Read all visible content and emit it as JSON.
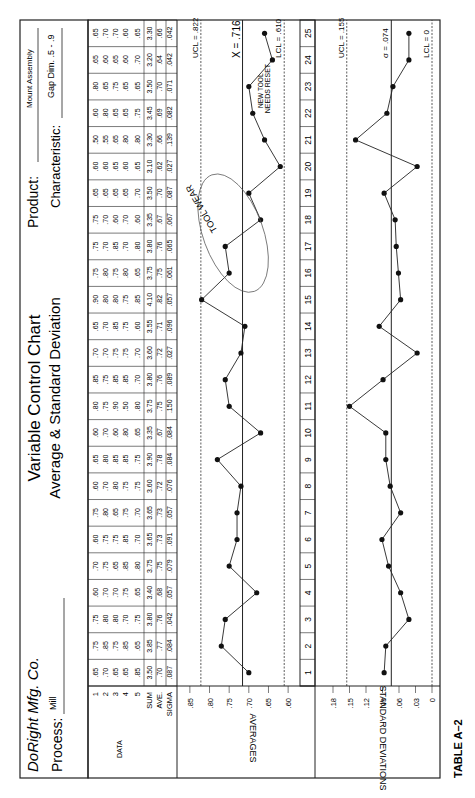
{
  "header": {
    "company": "DoRight Mfg. Co.",
    "process_label": "Process:",
    "process_value": "Mill",
    "title_line1": "Variable Control Chart",
    "title_line2": "Average & Standard Deviation",
    "product_label": "Product:",
    "product_value": "Mount Assembly",
    "characteristic_label": "Characteristic:",
    "characteristic_value": "Gap Dim. .5 - .9"
  },
  "table": {
    "row_labels": [
      "1",
      "2",
      "3",
      "4",
      "5",
      "SUM",
      "AVE.",
      "SIGMA"
    ],
    "data_label": "DATA",
    "columns": [
      {
        "sample": 1,
        "data": [
          ".65",
          ".70",
          ".65",
          ".65",
          ".85"
        ],
        "sum": "3.50",
        "ave": ".70",
        "sigma": ".087"
      },
      {
        "sample": 2,
        "data": [
          ".75",
          ".85",
          ".75",
          ".85",
          ".65"
        ],
        "sum": "3.85",
        "ave": ".77",
        "sigma": ".084"
      },
      {
        "sample": 3,
        "data": [
          ".75",
          ".80",
          ".80",
          ".70",
          ".75"
        ],
        "sum": "3.80",
        "ave": ".76",
        "sigma": ".042"
      },
      {
        "sample": 4,
        "data": [
          ".60",
          ".70",
          ".70",
          ".75",
          ".65"
        ],
        "sum": "3.40",
        "ave": ".68",
        "sigma": ".057"
      },
      {
        "sample": 5,
        "data": [
          ".70",
          ".75",
          ".65",
          ".85",
          ".80"
        ],
        "sum": "3.75",
        "ave": ".75",
        "sigma": ".079"
      },
      {
        "sample": 6,
        "data": [
          ".60",
          ".75",
          ".75",
          ".85",
          ".70"
        ],
        "sum": "3.65",
        "ave": ".73",
        "sigma": ".091"
      },
      {
        "sample": 7,
        "data": [
          ".75",
          ".80",
          ".65",
          ".75",
          ".70"
        ],
        "sum": "3.65",
        "ave": ".73",
        "sigma": ".057"
      },
      {
        "sample": 8,
        "data": [
          ".60",
          ".70",
          ".80",
          ".75",
          ".75"
        ],
        "sum": "3.60",
        "ave": ".72",
        "sigma": ".076"
      },
      {
        "sample": 9,
        "data": [
          ".65",
          ".80",
          ".85",
          ".85",
          ".75"
        ],
        "sum": "3.90",
        "ave": ".78",
        "sigma": ".084"
      },
      {
        "sample": 10,
        "data": [
          ".60",
          ".70",
          ".60",
          ".80",
          ".65"
        ],
        "sum": "3.35",
        "ave": ".67",
        "sigma": ".084"
      },
      {
        "sample": 11,
        "data": [
          ".80",
          ".75",
          ".90",
          ".50",
          ".80"
        ],
        "sum": "3.75",
        "ave": ".75",
        "sigma": ".150"
      },
      {
        "sample": 12,
        "data": [
          ".85",
          ".75",
          ".85",
          ".85",
          ".70"
        ],
        "sum": "3.80",
        "ave": ".76",
        "sigma": ".089"
      },
      {
        "sample": 13,
        "data": [
          ".70",
          ".70",
          ".75",
          ".75",
          ".70"
        ],
        "sum": "3.60",
        "ave": ".72",
        "sigma": ".027"
      },
      {
        "sample": 14,
        "data": [
          ".65",
          ".70",
          ".85",
          ".75",
          ".60"
        ],
        "sum": "3.55",
        "ave": ".71",
        "sigma": ".096"
      },
      {
        "sample": 15,
        "data": [
          ".90",
          ".80",
          ".80",
          ".75",
          ".85"
        ],
        "sum": "4.10",
        "ave": ".82",
        "sigma": ".057"
      },
      {
        "sample": 16,
        "data": [
          ".75",
          ".80",
          ".75",
          ".80",
          ".65"
        ],
        "sum": "3.75",
        "ave": ".75",
        "sigma": ".061"
      },
      {
        "sample": 17,
        "data": [
          ".75",
          ".70",
          ".85",
          ".70",
          ".80"
        ],
        "sum": "3.80",
        "ave": ".76",
        "sigma": ".065"
      },
      {
        "sample": 18,
        "data": [
          ".75",
          ".70",
          ".60",
          ".70",
          ".60"
        ],
        "sum": "3.35",
        "ave": ".67",
        "sigma": ".067"
      },
      {
        "sample": 19,
        "data": [
          ".65",
          ".65",
          ".65",
          ".65",
          ".70"
        ],
        "sum": "3.50",
        "ave": ".70",
        "sigma": ".087"
      },
      {
        "sample": 20,
        "data": [
          ".60",
          ".60",
          ".65",
          ".60",
          ".65"
        ],
        "sum": "3.10",
        "ave": ".62",
        "sigma": ".027"
      },
      {
        "sample": 21,
        "data": [
          ".50",
          ".55",
          ".65",
          ".80",
          ".80"
        ],
        "sum": "3.30",
        "ave": ".66",
        "sigma": ".139"
      },
      {
        "sample": 22,
        "data": [
          ".60",
          ".80",
          ".65",
          ".65",
          ".75"
        ],
        "sum": "3.45",
        "ave": ".69",
        "sigma": ".082"
      },
      {
        "sample": 23,
        "data": [
          ".80",
          ".65",
          ".75",
          ".65",
          ".65"
        ],
        "sum": "3.50",
        "ave": ".70",
        "sigma": ".071"
      },
      {
        "sample": 24,
        "data": [
          ".65",
          ".60",
          ".65",
          ".60",
          ".70"
        ],
        "sum": "3.20",
        "ave": ".64",
        "sigma": ".042"
      },
      {
        "sample": 25,
        "data": [
          ".65",
          ".70",
          ".70",
          ".60",
          ".65"
        ],
        "sum": "3.30",
        "ave": ".66",
        "sigma": ".042"
      }
    ]
  },
  "footer": {
    "caption": "TABLE A–2"
  },
  "chart_data": [
    {
      "type": "line",
      "title": "Averages",
      "ylabel": "AVERAGES",
      "x": [
        1,
        2,
        3,
        4,
        5,
        6,
        7,
        8,
        9,
        10,
        11,
        12,
        13,
        14,
        15,
        16,
        17,
        18,
        19,
        20,
        21,
        22,
        23,
        24,
        25
      ],
      "values": [
        0.7,
        0.77,
        0.76,
        0.68,
        0.75,
        0.73,
        0.73,
        0.72,
        0.78,
        0.67,
        0.75,
        0.76,
        0.72,
        0.71,
        0.82,
        0.75,
        0.76,
        0.67,
        0.7,
        0.62,
        0.66,
        0.69,
        0.7,
        0.64,
        0.66
      ],
      "yticks": [
        ".85",
        ".80",
        ".75",
        ".70",
        ".65",
        ".60"
      ],
      "ylim": [
        0.58,
        0.87
      ],
      "center_line": {
        "label": "X = .716",
        "value": 0.716
      },
      "ucl": {
        "label": "UCL = .822",
        "value": 0.822
      },
      "lcl": {
        "label": "LCL = .610",
        "value": 0.61
      },
      "annotations": [
        "TOOL WEAR",
        "NEW TOOL",
        "NEEDS RESET"
      ]
    },
    {
      "type": "line",
      "title": "Standard Deviations",
      "ylabel": "STANDARD DEVIATIONS",
      "x": [
        1,
        2,
        3,
        4,
        5,
        6,
        7,
        8,
        9,
        10,
        11,
        12,
        13,
        14,
        15,
        16,
        17,
        18,
        19,
        20,
        21,
        22,
        23,
        24,
        25
      ],
      "values": [
        0.087,
        0.084,
        0.042,
        0.057,
        0.079,
        0.091,
        0.057,
        0.076,
        0.084,
        0.084,
        0.15,
        0.089,
        0.027,
        0.096,
        0.057,
        0.061,
        0.065,
        0.067,
        0.087,
        0.027,
        0.139,
        0.082,
        0.071,
        0.042,
        0.042
      ],
      "yticks": [
        ".18",
        ".15",
        ".12",
        ".09",
        ".06",
        ".03",
        "0"
      ],
      "ylim": [
        0,
        0.2
      ],
      "center_line": {
        "label": "σ = .074",
        "value": 0.074
      },
      "ucl": {
        "label": "UCL = .155",
        "value": 0.155
      },
      "lcl": {
        "label": "LCL = 0",
        "value": 0
      }
    }
  ]
}
